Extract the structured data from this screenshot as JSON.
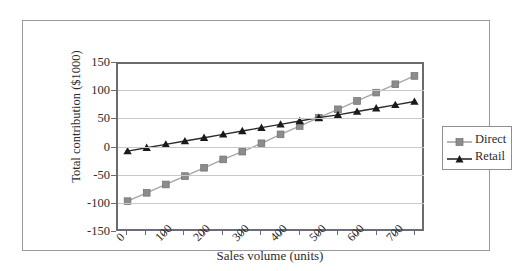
{
  "chart_data": {
    "type": "line",
    "title": "",
    "xlabel": "Sales volume (units)",
    "ylabel": "Total contribution ($1000)",
    "xlim": [
      0,
      800
    ],
    "ylim": [
      -150,
      150
    ],
    "yticks": [
      150,
      100,
      50,
      0,
      -50,
      -100,
      -150
    ],
    "xticks": [
      0,
      100,
      200,
      300,
      400,
      500,
      600,
      700
    ],
    "xticklabels": [
      "0",
      "100",
      "200",
      "300",
      "400",
      "500",
      "600",
      "700"
    ],
    "yticklabels": [
      "150",
      "100",
      "50",
      "0",
      "-50",
      "-100",
      "-150"
    ],
    "grid": "horizontal",
    "legend_position": "right-outside",
    "x": [
      25,
      75,
      125,
      175,
      225,
      275,
      325,
      375,
      425,
      475,
      525,
      575,
      625,
      675,
      725,
      775
    ],
    "series": [
      {
        "name": "Direct",
        "marker": "square",
        "color": "#8c8c8c",
        "line_color": "#a6a6a6",
        "values": [
          -100,
          -85,
          -70,
          -55,
          -40,
          -25,
          -11,
          4,
          20,
          35,
          50,
          65,
          80,
          95,
          110,
          125
        ]
      },
      {
        "name": "Retail",
        "marker": "triangle",
        "color": "#1a1a1a",
        "line_color": "#2b2b2b",
        "values": [
          -10,
          -4,
          2,
          8,
          14,
          20,
          26,
          32,
          38,
          44,
          50,
          55,
          61,
          67,
          73,
          79
        ]
      }
    ]
  },
  "legend": {
    "items": [
      {
        "label": "Direct"
      },
      {
        "label": "Retail"
      }
    ]
  },
  "colors": {
    "axis": "#6b6b6b",
    "grid": "#c8c8c8",
    "frame": "#9a9a9a",
    "text": "#2b2b2b",
    "direct": "#8c8c8c",
    "retail": "#1a1a1a"
  }
}
